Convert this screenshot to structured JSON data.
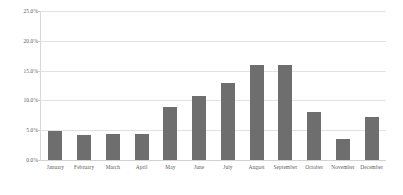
{
  "chart_data": {
    "type": "bar",
    "title": "",
    "xlabel": "",
    "ylabel": "",
    "categories": [
      "January",
      "February",
      "March",
      "April",
      "May",
      "June",
      "July",
      "August",
      "September",
      "October",
      "November",
      "December"
    ],
    "values": [
      4.8,
      4.2,
      4.4,
      4.4,
      8.9,
      10.7,
      13.0,
      16.0,
      16.0,
      8.0,
      3.5,
      7.2
    ],
    "value_suffix": "%",
    "ylim": [
      0,
      25
    ],
    "ytick_values": [
      0,
      5,
      10,
      15,
      20,
      25
    ],
    "ytick_labels": [
      "0.0%",
      "5.0%",
      "10.0%",
      "15.0%",
      "20.0%",
      "25.0%"
    ],
    "grid": true,
    "legend": false,
    "legend_position": "none",
    "bar_color": "#6e6e6e",
    "gridline_color": "#e2e2e2",
    "axis_color": "#d8d8d8",
    "tick_label_color": "#5c5c5c",
    "background_color": "#ffffff"
  }
}
